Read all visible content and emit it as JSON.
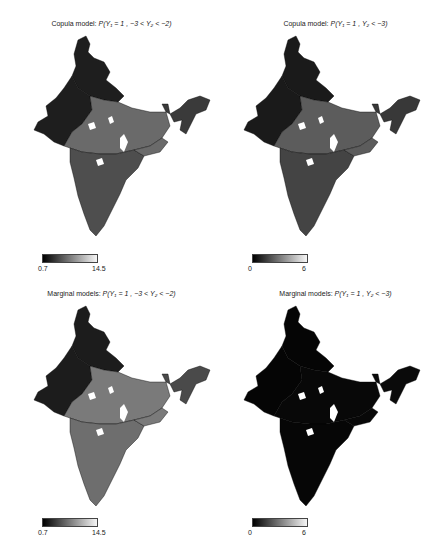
{
  "figure": {
    "panels": [
      {
        "id": "copula-range",
        "title_prefix": "Copula model: ",
        "formula": "P(Y₁ = 1 , −3 < Y₂ < −2)",
        "colorbar": {
          "min": "0.7",
          "max": "14.5"
        },
        "shade": {
          "north": "#1e1e1e",
          "center": "#6a6a6a",
          "south": "#4e4e4e",
          "east": "#3a3a3a"
        }
      },
      {
        "id": "copula-tail",
        "title_prefix": "Copula model: ",
        "formula": "P(Y₁ = 1 , Y₂ < −3)",
        "colorbar": {
          "min": "0",
          "max": "6"
        },
        "shade": {
          "north": "#1a1a1a",
          "center": "#5c5c5c",
          "south": "#444444",
          "east": "#383838"
        }
      },
      {
        "id": "marginal-range",
        "title_prefix": "Marginal models: ",
        "formula": "P(Y₁ = 1 , −3 < Y₂ < −2)",
        "colorbar": {
          "min": "0.7",
          "max": "14.5"
        },
        "shade": {
          "north": "#1c1c1c",
          "center": "#7a7a7a",
          "south": "#6e6e6e",
          "east": "#4a4a4a"
        }
      },
      {
        "id": "marginal-tail",
        "title_prefix": "Marginal models: ",
        "formula": "P(Y₁ = 1 , Y₂ < −3)",
        "colorbar": {
          "min": "0",
          "max": "6"
        },
        "shade": {
          "north": "#050505",
          "center": "#080808",
          "south": "#060606",
          "east": "#0a0a0a"
        }
      }
    ]
  }
}
